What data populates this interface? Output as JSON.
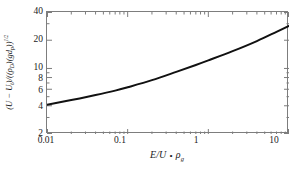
{
  "chart_data": {
    "type": "line",
    "title": "",
    "subtitle": "",
    "xlabel": "E/U • ρg",
    "ylabel": "(U − Ut)/((ρD)(gdp))^(1/2)",
    "xscale": "log",
    "yscale": "log",
    "xlim": [
      0.01,
      10
    ],
    "ylim": [
      2,
      40
    ],
    "grid": false,
    "legend": null,
    "xticks": [
      {
        "value": 0.01,
        "label": "0.01"
      },
      {
        "value": 0.1,
        "label": "0.1"
      },
      {
        "value": 1,
        "label": "1"
      },
      {
        "value": 10,
        "label": "10"
      }
    ],
    "yticks": [
      {
        "value": 2,
        "label": "2"
      },
      {
        "value": 4,
        "label": "4"
      },
      {
        "value": 6,
        "label": "6"
      },
      {
        "value": 8,
        "label": "8"
      },
      {
        "value": 10,
        "label": "10"
      },
      {
        "value": 20,
        "label": "20"
      },
      {
        "value": 40,
        "label": "40"
      }
    ],
    "series": [
      {
        "name": "curve",
        "color": "#111111",
        "linewidth": 2.0,
        "x": [
          0.01,
          0.02,
          0.04,
          0.07,
          0.1,
          0.2,
          0.4,
          0.7,
          1.0,
          2.0,
          4.0,
          7.0,
          10.0
        ],
        "y": [
          4.1,
          4.6,
          5.2,
          5.8,
          6.3,
          7.5,
          9.2,
          10.9,
          12.2,
          15.3,
          19.6,
          24.6,
          28.5
        ]
      }
    ]
  },
  "axis_labels": {
    "x_title_parts": {
      "e_over_u": "E/U",
      "dot": "•",
      "rho": "ρ",
      "g_sub": "g"
    },
    "y_title_parts": {
      "open": "(",
      "u": "U",
      "minus": " − ",
      "u2": "U",
      "t_sub": "t",
      "close_div": ")/((",
      "rho": "ρ",
      "d_sub": "D",
      "mid": ")(",
      "g": "g",
      "d": "d",
      "p_sub": "p",
      "tail": "))",
      "exp": "1/2"
    }
  }
}
